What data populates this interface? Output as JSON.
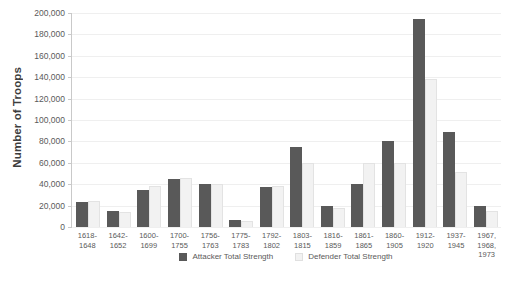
{
  "chart_data": {
    "type": "bar",
    "title": "",
    "xlabel": "",
    "ylabel": "Number of Troops",
    "ylim": [
      0,
      200000
    ],
    "ytick_step": 20000,
    "ytick_labels": [
      "200,000",
      "180,000",
      "160,000",
      "140,000",
      "120,000",
      "100,000",
      "80,000",
      "60,000",
      "40,000",
      "20,000",
      "0"
    ],
    "grid": true,
    "legend_position": "bottom",
    "categories": [
      "1618-\n1648",
      "1642-\n1652",
      "1600-\n1699",
      "1700-\n1755",
      "1756-\n1763",
      "1775-\n1783",
      "1792-\n1802",
      "1803-\n1815",
      "1816-\n1859",
      "1861-\n1865",
      "1860-\n1905",
      "1912-\n1920",
      "1937-\n1945",
      "1967,\n1968,\n1973"
    ],
    "series": [
      {
        "name": "Attacker Total Strength",
        "color": "#595959",
        "values": [
          23000,
          15000,
          35000,
          45000,
          40000,
          7000,
          37000,
          75000,
          20000,
          40000,
          80000,
          194000,
          89000,
          20000
        ]
      },
      {
        "name": "Defender Total Strength",
        "color": "#f2f2f2",
        "values": [
          24000,
          14000,
          38000,
          46000,
          40000,
          6000,
          38000,
          60000,
          18000,
          60000,
          60000,
          138000,
          51000,
          15000
        ]
      }
    ]
  }
}
